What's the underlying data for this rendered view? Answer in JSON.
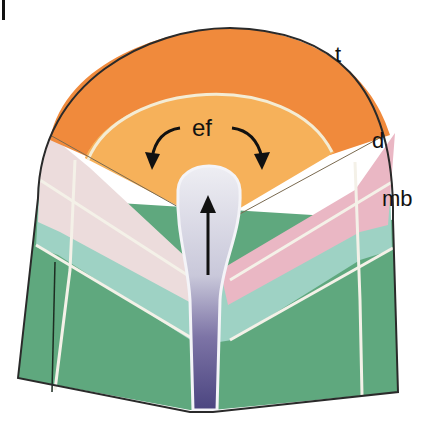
{
  "figure": {
    "corner_mark": "|",
    "labels": {
      "t": "t",
      "d": "d",
      "mb": "mb",
      "ef": "ef"
    },
    "colors": {
      "t_outer": "#f08a3c",
      "ef_inner": "#f6b15a",
      "d_left": "#ecdcdc",
      "d_right": "#eab7c4",
      "mb_band": "#9ed2c4",
      "base_green": "#5fa87e",
      "tube_light": "#dcdde6",
      "tube_dark": "#4b4580",
      "outline": "#2a2a2a",
      "seam": "#f4f1e8"
    },
    "arrows": {
      "up_arrow": "upward arrow in tube",
      "left_curve": "curved arrow left",
      "right_curve": "curved arrow right"
    }
  }
}
